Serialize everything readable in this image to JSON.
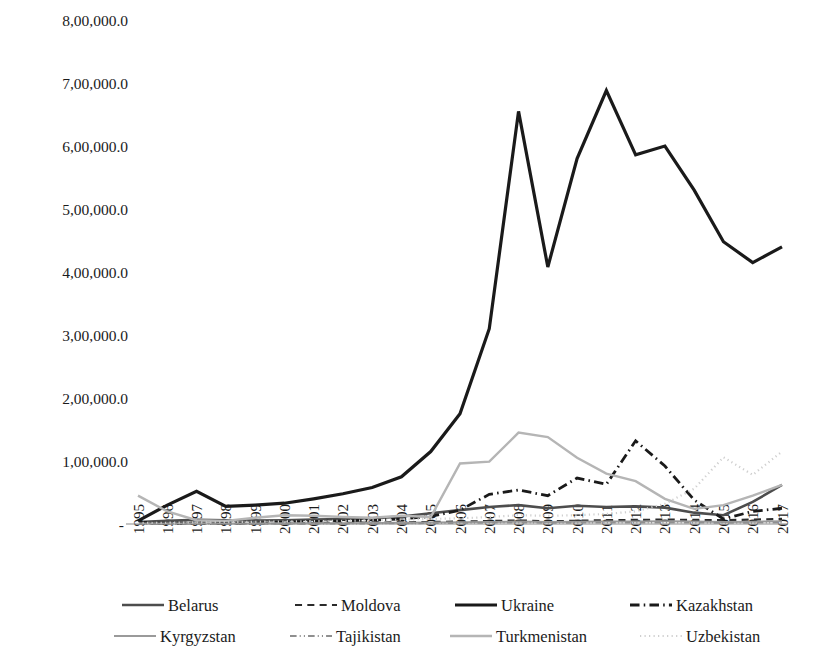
{
  "chart_data": {
    "type": "line",
    "title": "",
    "xlabel": "",
    "ylabel": "",
    "x": [
      1995,
      1996,
      1997,
      1998,
      1999,
      2000,
      2001,
      2002,
      2003,
      2004,
      2005,
      2006,
      2007,
      2008,
      2009,
      2010,
      2011,
      2012,
      2013,
      2014,
      2015,
      2016,
      2017
    ],
    "x_tick_labels": [
      "1995",
      "1996",
      "1997",
      "1998",
      "1999",
      "2000",
      "2001",
      "2002",
      "2003",
      "2004",
      "2005",
      "2006",
      "2007",
      "2008",
      "2009",
      "2010",
      "2011",
      "2012",
      "2013",
      "2014",
      "2015",
      "2016",
      "2017"
    ],
    "y_tick_labels": [
      "8,00,000.0",
      "7,00,000.0",
      "6,00,000.0",
      "5,00,000.0",
      "4,00,000.0",
      "3,00,000.0",
      "2,00,000.0",
      "1,00,000.0",
      "-"
    ],
    "y_tick_values": [
      800000,
      700000,
      600000,
      500000,
      400000,
      300000,
      200000,
      100000,
      0
    ],
    "ylim": [
      0,
      800000
    ],
    "grid": false,
    "legend_position": "bottom",
    "number_format": "indian",
    "series": [
      {
        "name": "Belarus",
        "color": "#4d4d4d",
        "style": "solid",
        "width": 2.6,
        "values": [
          3000,
          5000,
          6500,
          6000,
          5500,
          6000,
          7000,
          8000,
          9000,
          12000,
          17000,
          22000,
          27000,
          30000,
          25000,
          29000,
          27000,
          28000,
          26000,
          18000,
          14000,
          35000,
          62000
        ]
      },
      {
        "name": "Moldova",
        "color": "#2b2b2b",
        "style": "dashed",
        "width": 2.2,
        "values": [
          1000,
          1200,
          1500,
          1300,
          1200,
          1300,
          1600,
          1800,
          2200,
          2600,
          3200,
          3800,
          4600,
          5600,
          4200,
          5200,
          6000,
          6500,
          7000,
          6500,
          6000,
          7000,
          8000
        ]
      },
      {
        "name": "Ukraine",
        "color": "#1a1a1a",
        "style": "solid",
        "width": 3.2,
        "values": [
          5000,
          30000,
          52000,
          28000,
          30000,
          33000,
          40000,
          48000,
          58000,
          75000,
          115000,
          175000,
          310000,
          655000,
          408000,
          580000,
          688000,
          586000,
          600000,
          530000,
          448000,
          415000,
          440000
        ]
      },
      {
        "name": "Kazakhstan",
        "color": "#1a1a1a",
        "style": "dashdot",
        "width": 2.8,
        "values": [
          2500,
          1000,
          1500,
          1200,
          1500,
          3000,
          4000,
          5000,
          6000,
          8000,
          12000,
          22000,
          47000,
          54000,
          45000,
          73000,
          63000,
          132000,
          92000,
          38000,
          8000,
          20000,
          25000
        ]
      },
      {
        "name": "Kyrgyzstan",
        "color": "#9a9a9a",
        "style": "solid",
        "width": 2.0,
        "values": [
          900,
          900,
          1000,
          900,
          900,
          1000,
          1100,
          1300,
          1500,
          1800,
          2200,
          2600,
          3200,
          3800,
          3000,
          3400,
          3800,
          4000,
          4200,
          3800,
          3200,
          3600,
          4200
        ]
      },
      {
        "name": "Tajikistan",
        "color": "#8f8f8f",
        "style": "dashdotdot",
        "width": 1.8,
        "values": [
          500,
          400,
          400,
          400,
          400,
          500,
          600,
          700,
          800,
          1000,
          1300,
          1600,
          2000,
          2400,
          1800,
          2000,
          2200,
          2400,
          2400,
          2200,
          1800,
          2000,
          2200
        ]
      },
      {
        "name": "Turkmenistan",
        "color": "#b5b5b5",
        "style": "solid",
        "width": 2.4,
        "values": [
          45000,
          20000,
          6000,
          5000,
          10000,
          14000,
          13000,
          11000,
          10000,
          13000,
          11000,
          96000,
          99000,
          145000,
          138000,
          105000,
          80000,
          68000,
          40000,
          24000,
          30000,
          45000,
          62000
        ]
      },
      {
        "name": "Uzbekistan",
        "color": "#cfcfcf",
        "style": "dotted",
        "width": 2.2,
        "values": [
          2000,
          2000,
          2500,
          3000,
          3500,
          4000,
          4500,
          5000,
          6000,
          7000,
          8000,
          9000,
          11000,
          14000,
          13000,
          14000,
          16000,
          20000,
          32000,
          56000,
          106000,
          78000,
          115000
        ]
      }
    ]
  },
  "legend": {
    "rows": [
      [
        "Belarus",
        "Moldova",
        "Ukraine",
        "Kazakhstan"
      ],
      [
        "Kyrgyzstan",
        "Tajikistan",
        "Turkmenistan",
        "Uzbekistan"
      ]
    ]
  }
}
